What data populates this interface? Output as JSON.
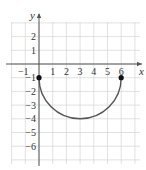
{
  "chart_data": {
    "type": "line",
    "title": "",
    "xlabel": "x",
    "ylabel": "y",
    "xlim": [
      -2,
      7
    ],
    "ylim": [
      -7,
      3
    ],
    "grid": true,
    "x_ticks": [
      "-1",
      "1",
      "2",
      "3",
      "4",
      "5",
      "6"
    ],
    "y_ticks": [
      "2",
      "1",
      "-1",
      "-2",
      "-3",
      "-4",
      "-5",
      "-6"
    ],
    "series": [
      {
        "name": "lower semicircle",
        "description": "Lower half of circle centered (3,-1) radius 3",
        "x": [
          0,
          0.5,
          1,
          1.5,
          2,
          2.5,
          3,
          3.5,
          4,
          4.5,
          5,
          5.5,
          6
        ],
        "y": [
          -1,
          -2.66,
          -3.24,
          -3.6,
          -3.83,
          -3.96,
          -4,
          -3.96,
          -3.83,
          -3.6,
          -3.24,
          -2.66,
          -1
        ]
      }
    ],
    "points": [
      {
        "x": 0,
        "y": -1,
        "filled": true
      },
      {
        "x": 6,
        "y": -1,
        "filled": true
      }
    ]
  },
  "colors": {
    "grid": "#d4d4d4",
    "axis": "#555555",
    "curve": "#555555",
    "point": "#111111"
  }
}
